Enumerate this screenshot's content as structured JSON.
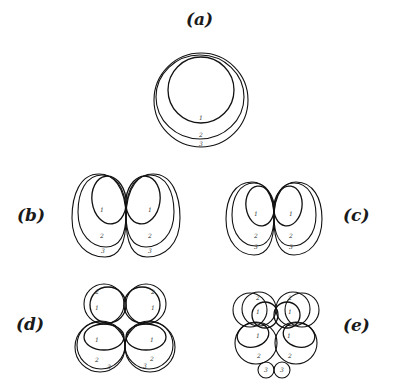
{
  "panels": {
    "a": {
      "label": "(a)",
      "contours": [
        "1",
        "2",
        "3"
      ]
    },
    "b": {
      "label": "(b)",
      "contours": [
        "1",
        "2",
        "3",
        "1",
        "2",
        "3"
      ]
    },
    "c": {
      "label": "(c)",
      "contours": [
        "1",
        "2",
        "3",
        "1",
        "2",
        "3"
      ]
    },
    "d": {
      "label": "(d)",
      "contours_top": [
        "2",
        "1",
        "2",
        "1"
      ],
      "contours_bottom": [
        "1",
        "2",
        "3",
        "1",
        "2",
        "3"
      ]
    },
    "e": {
      "label": "(e)",
      "contours_top": [
        "2",
        "1",
        "2",
        "1"
      ],
      "contours_middle": [
        "1",
        "2",
        "1",
        "2"
      ],
      "contours_bottom": [
        "3",
        "3"
      ]
    }
  }
}
